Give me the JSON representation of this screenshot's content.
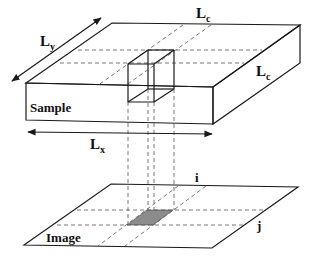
{
  "diagram": {
    "labels": {
      "sample": "Sample",
      "image": "Image",
      "ly": {
        "base": "L",
        "sub": "y"
      },
      "lc_top": {
        "base": "L",
        "sub": "c"
      },
      "lc_side": {
        "base": "L",
        "sub": "c"
      },
      "lx": {
        "base": "L",
        "sub": "x"
      },
      "i": "i",
      "j": "j"
    },
    "colors": {
      "line": "#1a1a1a",
      "dashed": "#555555",
      "shaded_pixel": "#8c8c8c",
      "background": "#ffffff"
    }
  }
}
